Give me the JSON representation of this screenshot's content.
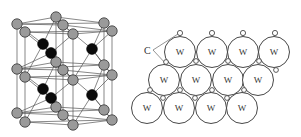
{
  "figure": {
    "left_panel": {
      "description": "hexagonal crystal lattice with gray and black atoms",
      "gray_atom_color": "#9a9a9a",
      "black_atom_color": "#0a0a0a"
    },
    "right_panel": {
      "carbon_label": "C",
      "tungsten_label": "W",
      "rows": [
        [
          "W",
          "W",
          "W",
          "W"
        ],
        [
          "W",
          "W",
          "W",
          "W"
        ],
        [
          "W",
          "W",
          "W",
          "W"
        ]
      ]
    }
  }
}
